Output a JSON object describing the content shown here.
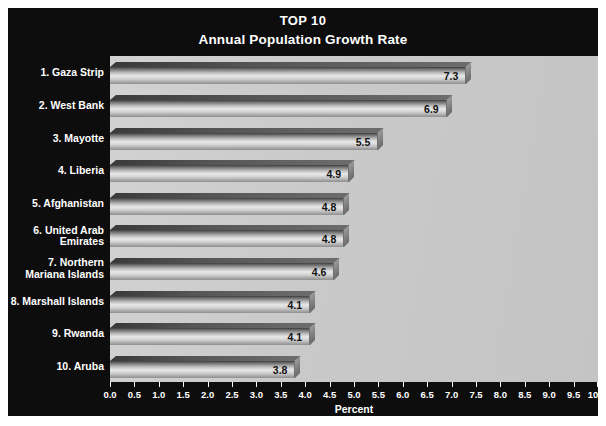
{
  "chart_data": {
    "type": "bar",
    "orientation": "horizontal",
    "title": "TOP 10",
    "subtitle": "Annual Population Growth Rate",
    "xlabel": "Percent",
    "ylabel": "",
    "xlim": [
      0.0,
      10.0
    ],
    "xticks": [
      "0.0",
      "0.5",
      "1.0",
      "1.5",
      "2.0",
      "2.5",
      "3.0",
      "3.5",
      "4.0",
      "4.5",
      "5.0",
      "5.5",
      "6.0",
      "6.5",
      "7.0",
      "7.5",
      "8.0",
      "8.5",
      "9.0",
      "9.5",
      "10.0"
    ],
    "grid": false,
    "legend": false,
    "categories": [
      "1. Gaza Strip",
      "2. West Bank",
      "3. Mayotte",
      "4. Liberia",
      "5. Afghanistan",
      "6. United Arab Emirates",
      "7. Northern Mariana Islands",
      "8. Marshall Islands",
      "9. Rwanda",
      "10. Aruba"
    ],
    "values": [
      7.3,
      6.9,
      5.5,
      4.9,
      4.8,
      4.8,
      4.6,
      4.1,
      4.1,
      3.8
    ],
    "value_labels": [
      "7.3",
      "6.9",
      "5.5",
      "4.9",
      "4.8",
      "4.8",
      "4.6",
      "4.1",
      "4.1",
      "3.8"
    ],
    "colors": {
      "figure_background": "#0d0d0d",
      "plot_background": "#c9c9c9",
      "bar_fill": "#d2d2d2",
      "text": "#ffffff",
      "value_text": "#111111",
      "page_background": "#ffffff"
    }
  }
}
